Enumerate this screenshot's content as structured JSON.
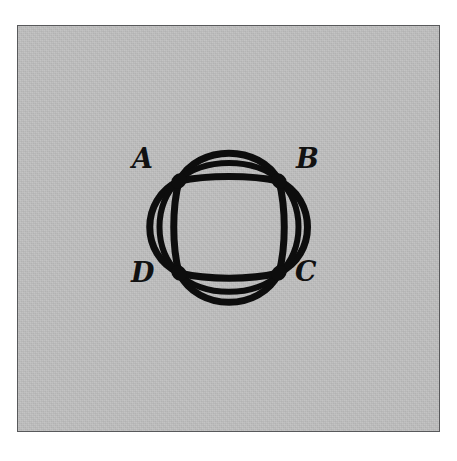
{
  "figure": {
    "background_color": "#ffffff",
    "plate_color": "#bdbdbd",
    "border_color": "#58595b",
    "ink_color": "#0d0d0d"
  },
  "graph": {
    "description": "Four vertices arranged at the corners of a square; each adjacent pair is joined by three parallel edges, one straight chord and two outward-bulging arcs, so the bundles together trace a circular rosette.",
    "vertex_count": 4,
    "edge_count": 12,
    "parallel_edges_per_pair": 3,
    "vertex_degree": 6,
    "vertices": [
      {
        "id": "A",
        "label": "A",
        "position": "top-left",
        "x": 161,
        "y": 155
      },
      {
        "id": "B",
        "label": "B",
        "position": "top-right",
        "x": 261,
        "y": 155
      },
      {
        "id": "C",
        "label": "C",
        "position": "bottom-right",
        "x": 261,
        "y": 247
      },
      {
        "id": "D",
        "label": "D",
        "position": "bottom-left",
        "x": 161,
        "y": 247
      }
    ],
    "edge_bundles": [
      {
        "id": "AB",
        "from": "A",
        "to": "B",
        "side": "top",
        "multiplicity": 3,
        "bulge": "outward-up"
      },
      {
        "id": "BC",
        "from": "B",
        "to": "C",
        "side": "right",
        "multiplicity": 3,
        "bulge": "outward-right"
      },
      {
        "id": "DC",
        "from": "D",
        "to": "C",
        "side": "bottom",
        "multiplicity": 3,
        "bulge": "outward-down"
      },
      {
        "id": "AD",
        "from": "A",
        "to": "D",
        "side": "left",
        "multiplicity": 3,
        "bulge": "outward-left"
      }
    ]
  }
}
